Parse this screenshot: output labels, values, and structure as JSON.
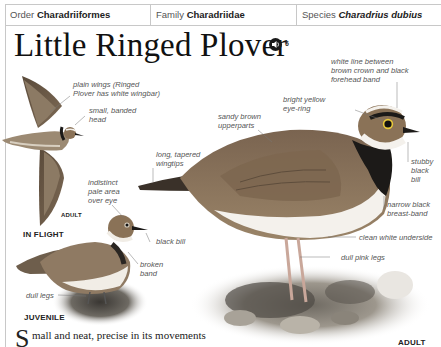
{
  "taxonomy": {
    "order_label": "Order",
    "order_value": "Charadriiformes",
    "family_label": "Family",
    "family_value": "Charadriidae",
    "species_label": "Species",
    "species_value": "Charadrius dubius"
  },
  "title": "Little Ringed Plover",
  "audio": {
    "icon": "speaker-icon",
    "track_number": "6"
  },
  "flight_bird": {
    "labels": {
      "plain_wings_1": "plain wings (Ringed",
      "plain_wings_2": "Plover has white wingbar)",
      "small_head_1": "small, banded",
      "small_head_2": "head"
    },
    "age": "ADULT",
    "caption": "IN FLIGHT"
  },
  "juvenile": {
    "labels": {
      "pale_area_1": "indistinct",
      "pale_area_2": "pale area",
      "pale_area_3": "over eye",
      "black_bill": "black bill",
      "broken_band_1": "broken",
      "broken_band_2": "band",
      "dull_legs": "dull legs"
    },
    "caption": "JUVENILE"
  },
  "adult": {
    "labels": {
      "white_line_1": "white line between",
      "white_line_2": "brown crown and black",
      "white_line_3": "forehead band",
      "eye_ring_1": "bright yellow",
      "eye_ring_2": "eye-ring",
      "upperparts_1": "sandy brown",
      "upperparts_2": "upperparts",
      "wingtips_1": "long, tapered",
      "wingtips_2": "wingtips",
      "bill_1": "stubby",
      "bill_2": "black",
      "bill_3": "bill",
      "breast_1": "narrow black",
      "breast_2": "breast-band",
      "underside": "clean white underside",
      "legs": "dull pink legs"
    },
    "caption": "ADULT"
  },
  "body": {
    "dropcap": "S",
    "text": "mall and neat, precise in its movements"
  },
  "colors": {
    "upperparts": "#8a7257",
    "underside": "#f4f1ec",
    "band": "#1c1a18",
    "eye_ring": "#e8c93a",
    "rule": "#c8c8c8"
  }
}
